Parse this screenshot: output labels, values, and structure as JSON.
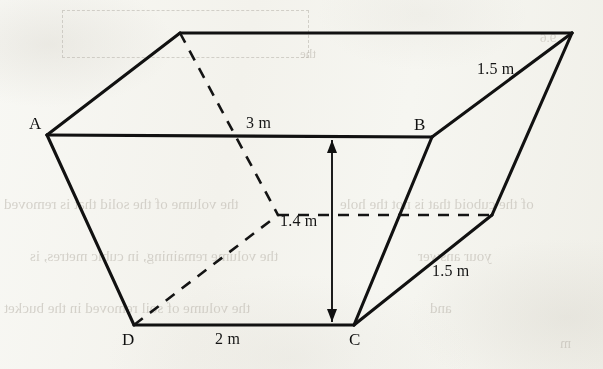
{
  "figure": {
    "shape_type": "trapezoidal-prism",
    "background_color": "#fbfbf9",
    "stroke_color": "#111111"
  },
  "vertex_labels": [
    {
      "id": "A",
      "text": "A",
      "x": 29,
      "y": 114
    },
    {
      "id": "B",
      "text": "B",
      "x": 414,
      "y": 115
    },
    {
      "id": "C",
      "text": "C",
      "x": 349,
      "y": 330
    },
    {
      "id": "D",
      "text": "D",
      "x": 122,
      "y": 330
    }
  ],
  "dimension_labels": [
    {
      "id": "top-edge",
      "text": "3 m",
      "x": 246,
      "y": 114
    },
    {
      "id": "bottom-edge",
      "text": "2 m",
      "x": 215,
      "y": 330
    },
    {
      "id": "height",
      "text": "1.4 m",
      "x": 280,
      "y": 212
    },
    {
      "id": "slant-upper-right",
      "text": "1.5 m",
      "x": 477,
      "y": 60
    },
    {
      "id": "slant-lower-right",
      "text": "1.5 m",
      "x": 432,
      "y": 262
    }
  ],
  "geometry": {
    "points": {
      "top_back_left": [
        180,
        33
      ],
      "top_back_right": [
        572,
        33
      ],
      "A": [
        47,
        135
      ],
      "B": [
        432,
        137
      ],
      "C": [
        354,
        325
      ],
      "D": [
        134,
        325
      ],
      "back_bottom_left": [
        278,
        215
      ],
      "back_bottom_right": [
        492,
        215
      ]
    },
    "solid_edges": [
      {
        "name": "top-back-edge",
        "from": "top_back_left",
        "to": "top_back_right"
      },
      {
        "name": "top-left-slant",
        "from": "A",
        "to": "top_back_left"
      },
      {
        "name": "front-top-edge-AB",
        "from": "A",
        "to": "B"
      },
      {
        "name": "right-top-slant-B",
        "from": "B",
        "to": "top_back_right"
      },
      {
        "name": "front-left-slant-AD",
        "from": "A",
        "to": "D"
      },
      {
        "name": "front-bottom-edge-DC",
        "from": "D",
        "to": "C"
      },
      {
        "name": "front-right-slant-BC",
        "from": "B",
        "to": "C"
      },
      {
        "name": "right-bottom-slant-C",
        "from": "C",
        "to": "back_bottom_right"
      },
      {
        "name": "right-back-slant",
        "from": "back_bottom_right",
        "to": "top_back_right"
      }
    ],
    "dashed_edges": [
      {
        "name": "hidden-back-left-vertical",
        "from": "top_back_left",
        "to": "back_bottom_left"
      },
      {
        "name": "hidden-back-bottom-edge",
        "from": "back_bottom_left",
        "to": "back_bottom_right"
      },
      {
        "name": "hidden-back-left-slant",
        "from": "D",
        "to": "back_bottom_left"
      }
    ],
    "height_arrow": {
      "name": "height-dimension-arrow",
      "x": 332,
      "y_top": 140,
      "y_bottom": 322
    }
  },
  "ghost_text": [
    {
      "text": "the volume of the solid that is removed",
      "x": 4,
      "y": 196,
      "size": 15
    },
    {
      "text": "of the cuboid that is not the hole",
      "x": 340,
      "y": 196,
      "size": 15
    },
    {
      "text": "the volume remaining, in cubic metres, is",
      "x": 30,
      "y": 248,
      "size": 15
    },
    {
      "text": "your answer",
      "x": 418,
      "y": 248,
      "size": 15
    },
    {
      "text": "the volume of soil removed in the bucket",
      "x": 4,
      "y": 300,
      "size": 15
    },
    {
      "text": "and",
      "x": 430,
      "y": 300,
      "size": 15
    },
    {
      "text": "m",
      "x": 560,
      "y": 336,
      "size": 14
    },
    {
      "text": "9.6",
      "x": 540,
      "y": 30,
      "size": 13
    },
    {
      "text": "the",
      "x": 300,
      "y": 46,
      "size": 13
    }
  ],
  "ghost_boxes": [
    {
      "x": 62,
      "y": 10,
      "w": 245,
      "h": 46
    }
  ]
}
